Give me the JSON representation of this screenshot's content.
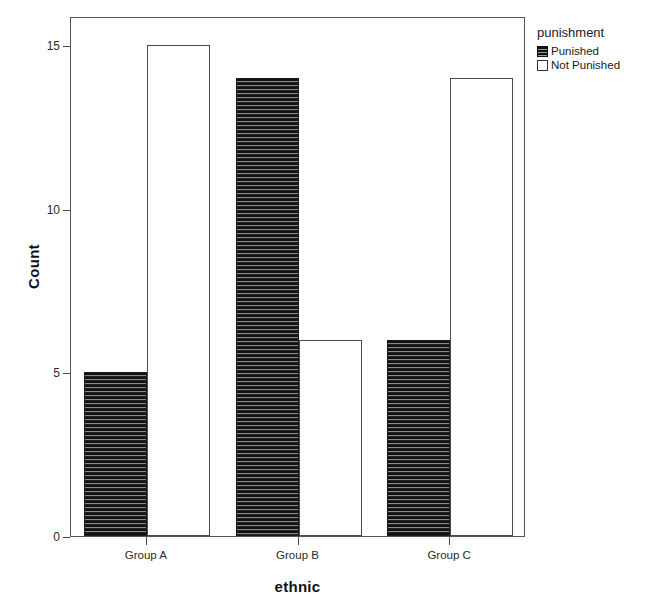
{
  "chart_data": {
    "type": "bar",
    "title": "",
    "xlabel": "ethnic",
    "ylabel": "Count",
    "categories": [
      "Group A",
      "Group B",
      "Group C"
    ],
    "series": [
      {
        "name": "Punished",
        "values": [
          5,
          14,
          6
        ],
        "fill": "hatched-dark",
        "color": "#2b2b2b"
      },
      {
        "name": "Not Punished",
        "values": [
          15,
          6,
          14
        ],
        "fill": "empty-white",
        "color": "#ffffff"
      }
    ],
    "ylim": [
      0,
      16
    ],
    "yticks": [
      0,
      5,
      10,
      15
    ],
    "ytick_labels": [
      "0",
      "5",
      "10",
      "15"
    ],
    "grid": false,
    "legend": {
      "title": "punishment",
      "position": "right-top",
      "entries": [
        "Punished",
        "Not Punished"
      ]
    },
    "frame": true,
    "grouping": "clustered"
  },
  "axes": {
    "y_title": "Count",
    "x_title": "ethnic"
  }
}
